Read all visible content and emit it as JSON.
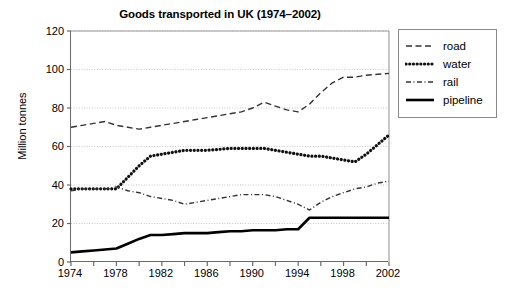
{
  "chart_data": {
    "type": "line",
    "title": "Goods transported in UK (1974–2002)",
    "xlabel": "",
    "ylabel": "Million tonnes",
    "xlim": [
      1974,
      2002
    ],
    "ylim": [
      0,
      120
    ],
    "y_ticks": [
      0,
      20,
      40,
      60,
      80,
      100,
      120
    ],
    "x_ticks": [
      1974,
      1976,
      1978,
      1980,
      1982,
      1984,
      1986,
      1988,
      1990,
      1992,
      1994,
      1996,
      1998,
      2000,
      2002
    ],
    "x_tick_labels": [
      "1974",
      "1978",
      "1982",
      "1986",
      "1990",
      "1994",
      "1998",
      "2002"
    ],
    "x_tick_label_years": [
      1974,
      1978,
      1982,
      1986,
      1990,
      1994,
      1998,
      2002
    ],
    "grid": "horizontal-dotted",
    "legend_position": "right",
    "x": [
      1974,
      1975,
      1976,
      1977,
      1978,
      1979,
      1980,
      1981,
      1982,
      1983,
      1984,
      1985,
      1986,
      1987,
      1988,
      1989,
      1990,
      1991,
      1992,
      1993,
      1994,
      1995,
      1996,
      1997,
      1998,
      1999,
      2000,
      2001,
      2002
    ],
    "series": [
      {
        "name": "road",
        "style": "dashed",
        "color": "#333333",
        "values": [
          70,
          71,
          72,
          73,
          71,
          70,
          69,
          70,
          71,
          72,
          73,
          74,
          75,
          76,
          77,
          78,
          80,
          83,
          81,
          79,
          78,
          82,
          88,
          93,
          96,
          96,
          97,
          97.5,
          98
        ]
      },
      {
        "name": "water",
        "style": "dotted",
        "color": "#111111",
        "values": [
          38,
          38,
          38,
          38,
          38,
          44,
          50,
          55,
          56,
          57,
          58,
          58,
          58,
          58.5,
          59,
          59,
          59,
          59,
          58,
          57,
          56,
          55,
          55,
          54,
          53,
          52,
          56,
          61,
          66
        ]
      },
      {
        "name": "rail",
        "style": "dashdot",
        "color": "#333333",
        "values": [
          37,
          38,
          38,
          38,
          39,
          37,
          36,
          34,
          33,
          32,
          30,
          31,
          32,
          33,
          34,
          35,
          35,
          35,
          34,
          32,
          30,
          27,
          31,
          34,
          36,
          38,
          39,
          41,
          42
        ]
      },
      {
        "name": "pipeline",
        "style": "solid",
        "color": "#000000",
        "values": [
          5,
          5.5,
          6,
          6.5,
          7,
          9.5,
          12,
          14,
          14,
          14.5,
          15,
          15,
          15,
          15.5,
          16,
          16,
          16.5,
          16.5,
          16.5,
          17,
          17,
          23,
          23,
          23,
          23,
          23,
          23,
          23,
          23
        ]
      }
    ]
  },
  "legend": {
    "items": [
      {
        "label": "road",
        "style": "dashed"
      },
      {
        "label": "water",
        "style": "dotted"
      },
      {
        "label": "rail",
        "style": "dashdot"
      },
      {
        "label": "pipeline",
        "style": "solid"
      }
    ]
  }
}
